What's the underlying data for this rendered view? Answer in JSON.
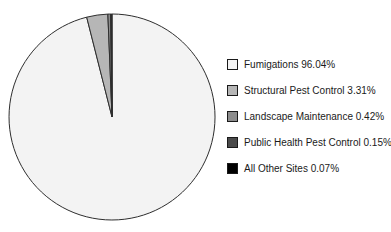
{
  "chart_data": {
    "type": "pie",
    "title": "",
    "categories": [
      "Fumigations",
      "Structural Pest Control",
      "Landscape Maintenance",
      "Public Health Pest Control",
      "All Other Sites"
    ],
    "values": [
      96.04,
      3.31,
      0.42,
      0.15,
      0.07
    ],
    "value_unit": "%",
    "legend_labels": [
      "Fumigations 96.04%",
      "Structural Pest Control 3.31%",
      "Landscape Maintenance 0.42%",
      "Public Health Pest Control 0.15%",
      "All Other Sites 0.07%"
    ],
    "colors": [
      "#f3f3f3",
      "#b6b6b6",
      "#8c8c8c",
      "#4a4a4a",
      "#000000"
    ],
    "slice_stroke_color": "#2e2e2e",
    "legend_swatch_border_color": "#1a1a1a",
    "text_color": "#1a1a1a",
    "background_color": "#ffffff",
    "legend_position": "right",
    "start_angle_deg": 0,
    "direction": "clockwise"
  }
}
